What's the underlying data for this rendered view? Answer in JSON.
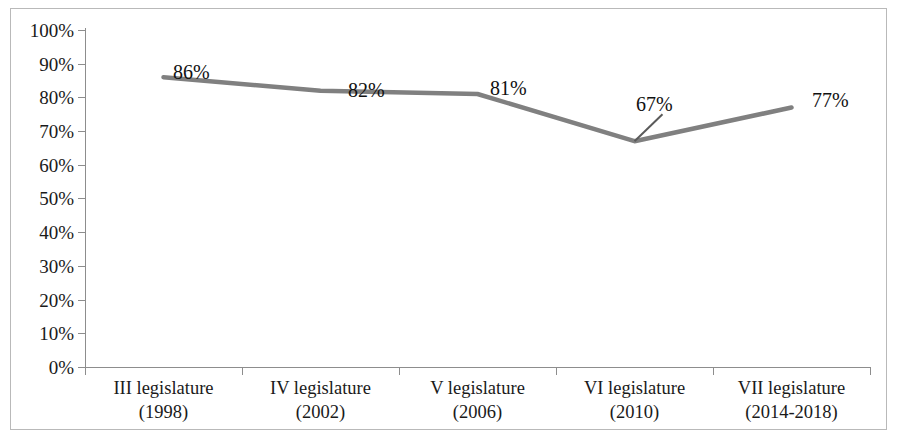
{
  "chart_data": {
    "type": "line",
    "title": "",
    "subtitle": "",
    "xlabel": "",
    "ylabel": "",
    "categories": [
      "III legislature (1998)",
      "IV legislature (2002)",
      "V legislature (2006)",
      "VI legislature (2010)",
      "VII legislature (2014-2018)"
    ],
    "category_lines": [
      {
        "line1": "III legislature",
        "line2": "(1998)"
      },
      {
        "line1": "IV legislature",
        "line2": "(2002)"
      },
      {
        "line1": "V legislature",
        "line2": "(2006)"
      },
      {
        "line1": "VI legislature",
        "line2": "(2010)"
      },
      {
        "line1": "VII legislature",
        "line2": "(2014-2018)"
      }
    ],
    "values": [
      86,
      82,
      81,
      67,
      77
    ],
    "point_labels": [
      "86%",
      "82%",
      "81%",
      "67%",
      "77%"
    ],
    "ylim": [
      0,
      100
    ],
    "ytick_step": 10,
    "ytick_labels": [
      "100%",
      "90%",
      "80%",
      "70%",
      "60%",
      "50%",
      "40%",
      "30%",
      "20%",
      "10%",
      "0%"
    ],
    "ytick_values": [
      100,
      90,
      80,
      70,
      60,
      50,
      40,
      30,
      20,
      10,
      0
    ],
    "grid": false,
    "legend": false,
    "legend_position": "none",
    "series": [
      {
        "name": "",
        "values": [
          86,
          82,
          81,
          67,
          77
        ],
        "color": "#808080",
        "line_width": 4,
        "markers": false
      }
    ],
    "annotations": [
      {
        "name": "leader-line-67",
        "from_label": "67%",
        "to_point_index": 3
      }
    ]
  },
  "colors": {
    "line": "#808080",
    "axis": "#8d8d8d",
    "frame": "#b9b9b9",
    "text": "#1a1a1a",
    "background": "#ffffff"
  }
}
